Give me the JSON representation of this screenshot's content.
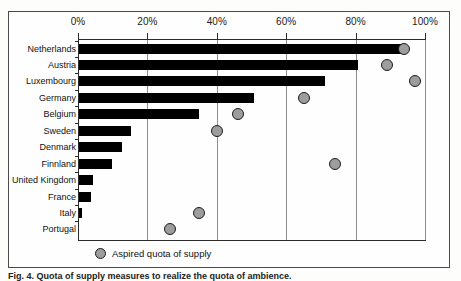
{
  "figure": {
    "caption": "Fig. 4. Quota of supply measures to realize the quota of ambience.",
    "legend": {
      "marker_label": "Aspired quota of supply",
      "marker_color": "#9d9d9d",
      "marker_outline": "#1c1c1c"
    },
    "bar_color": "#000000",
    "gridline_color": "#8e8e8e",
    "axis_color": "#2b2b2b"
  },
  "chart_data": {
    "type": "bar",
    "orientation": "horizontal",
    "title": "",
    "xlabel": "",
    "ylabel": "",
    "xlim": [
      0,
      100
    ],
    "xticks": [
      0,
      20,
      40,
      60,
      80,
      100
    ],
    "xtick_labels": [
      "0%",
      "20%",
      "40%",
      "60%",
      "80%",
      "100%"
    ],
    "grid": true,
    "legend_position": "bottom",
    "categories": [
      "Netherlands",
      "Austria",
      "Luxembourg",
      "Germany",
      "Belgium",
      "Sweden",
      "Denmark",
      "Finnland",
      "United Kingdom",
      "France",
      "Italy",
      "Portugal"
    ],
    "series": [
      {
        "name": "Current quota of supply",
        "type": "bar",
        "values": [
          93.5,
          80.5,
          71.0,
          50.5,
          34.5,
          15.0,
          12.5,
          9.5,
          4.0,
          3.5,
          1.0,
          0.0
        ]
      },
      {
        "name": "Aspired quota of supply",
        "type": "scatter",
        "values": [
          94.0,
          89.0,
          97.0,
          65.0,
          46.0,
          40.0,
          null,
          74.0,
          null,
          null,
          35.0,
          26.5
        ]
      }
    ]
  }
}
